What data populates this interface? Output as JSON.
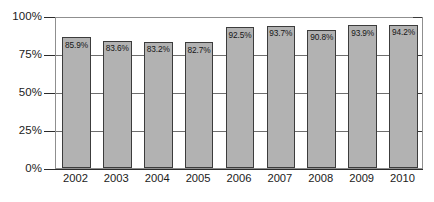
{
  "chart_data": {
    "type": "bar",
    "title": "",
    "subtitle": "",
    "xlabel": "",
    "ylabel": "",
    "categories": [
      "2002",
      "2003",
      "2004",
      "2005",
      "2006",
      "2007",
      "2008",
      "2009",
      "2010"
    ],
    "values": [
      85.9,
      83.6,
      83.2,
      82.7,
      92.5,
      93.7,
      90.8,
      93.9,
      94.2
    ],
    "data_labels": [
      "85.9%",
      "83.6%",
      "83.2%",
      "82.7%",
      "92.5%",
      "93.7%",
      "90.8%",
      "93.9%",
      "94.2%"
    ],
    "ylim": [
      0,
      100
    ],
    "yticks": [
      0,
      25,
      50,
      75,
      100
    ],
    "ytick_labels": [
      "0%",
      "25%",
      "50%",
      "75%",
      "100%"
    ],
    "grid": true,
    "grid_axis": "y",
    "legend": null,
    "legend_position": "none",
    "series": [
      {
        "name": "",
        "values": [
          85.9,
          83.6,
          83.2,
          82.7,
          92.5,
          93.7,
          90.8,
          93.9,
          94.2
        ]
      }
    ]
  },
  "style": {
    "bar_fill": "#b2b2b2",
    "bar_border": "#3c3c3c",
    "plot_border": "#8f8f8f",
    "gridline": "#6e6e6e",
    "axis": "#2b2b2b",
    "text": "#1b1b1b",
    "background": "#ffffff"
  }
}
